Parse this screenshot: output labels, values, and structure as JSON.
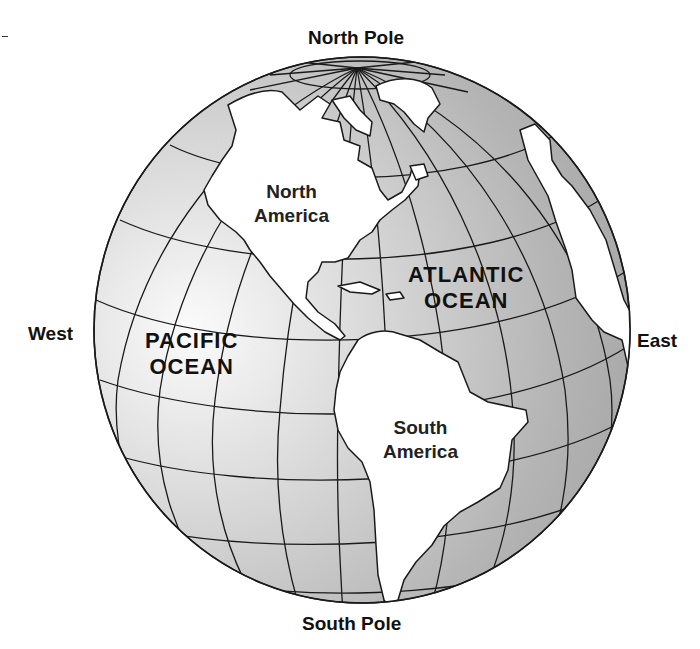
{
  "diagram": {
    "type": "globe-western-hemisphere",
    "labels": {
      "north_pole": "North Pole",
      "south_pole": "South Pole",
      "west": "West",
      "east": "East"
    },
    "oceans": {
      "pacific_line1": "PACIFIC",
      "pacific_line2": "OCEAN",
      "atlantic_line1": "ATLANTIC",
      "atlantic_line2": "OCEAN"
    },
    "continents": {
      "north_america_line1": "North",
      "north_america_line2": "America",
      "south_america_line1": "South",
      "south_america_line2": "America"
    },
    "colors": {
      "ocean_dark": "#a8a8a8",
      "ocean_light": "#f4f4f4",
      "land": "#ffffff",
      "lines": "#1a1a1a"
    }
  }
}
